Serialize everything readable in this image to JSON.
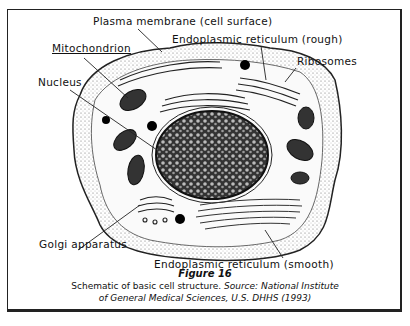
{
  "figure": {
    "labels": {
      "plasma_membrane": "Plasma membrane (cell surface)",
      "er_rough": "Endoplasmic reticulum (rough)",
      "mitochondrion": "Mitochondrion",
      "ribosomes": "Ribosomes",
      "nucleus": "Nucleus",
      "golgi": "Golgi apparatus",
      "er_smooth": "Endoplasmic reticulum (smooth)"
    },
    "caption": {
      "title": "Figure 16",
      "line1_plain": "Schematic of basic cell structure. ",
      "line1_italic": "Source: National Institute",
      "line2_italic": "of General Medical Sciences, U.S. DHHS (1993)"
    }
  }
}
